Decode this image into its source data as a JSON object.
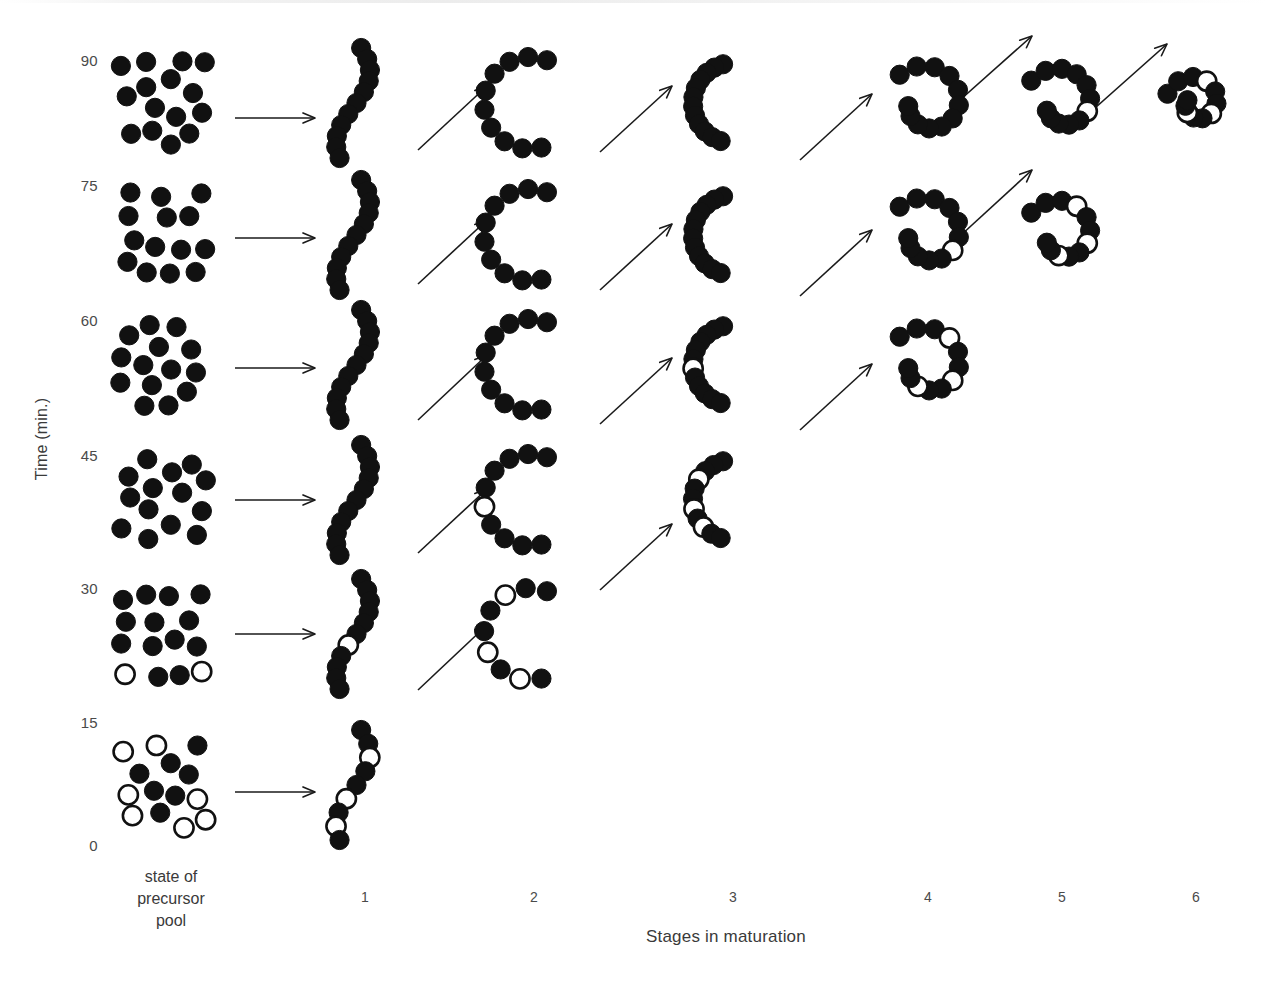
{
  "figure": {
    "kind": "time-course maturation diagram",
    "background_color": "#ffffff",
    "bead_filled_color": "#111111",
    "bead_open_color": "#ffffff",
    "bead_outline_color": "#111111",
    "arrow_color": "#1a1a1a"
  },
  "axes": {
    "y_label": "Time (min.)",
    "y_ticks": [
      "90",
      "75",
      "60",
      "45",
      "30",
      "15",
      "0"
    ],
    "x_label": "Stages in maturation",
    "x_ticks": [
      "1",
      "2",
      "3",
      "4",
      "5",
      "6"
    ],
    "pool_caption_line1": "state of",
    "pool_caption_line2": "precursor",
    "pool_caption_line3": "pool"
  },
  "chart_data": {
    "type": "scatter",
    "title": "",
    "xlabel": "Stages in maturation",
    "ylabel": "Time (min.)",
    "ylim": [
      0,
      90
    ],
    "y_tick_values": [
      0,
      15,
      30,
      45,
      60,
      75,
      90
    ],
    "x_categories": [
      "state of precursor pool",
      "1",
      "2",
      "3",
      "4",
      "5",
      "6"
    ],
    "grid": false,
    "legend": "none",
    "rows": [
      {
        "time": 90,
        "pool": {
          "total": 15,
          "open": 0,
          "filled": 15
        },
        "stages": [
          {
            "stage": 1,
            "beads": 11,
            "open": 0,
            "shape": "extended s-curve chain"
          },
          {
            "stage": 2,
            "beads": 10,
            "open": 0,
            "shape": "open C arc"
          },
          {
            "stage": 3,
            "beads": 12,
            "open": 0,
            "shape": "closed horseshoe"
          },
          {
            "stage": 4,
            "beads": 12,
            "open": 0,
            "shape": "compact spiral"
          },
          {
            "stage": 5,
            "beads": 12,
            "open": 1,
            "shape": "tight spiral"
          },
          {
            "stage": 6,
            "beads": 12,
            "open": 3,
            "shape": "condensed particle"
          }
        ]
      },
      {
        "time": 75,
        "pool": {
          "total": 14,
          "open": 0,
          "filled": 14
        },
        "stages": [
          {
            "stage": 1,
            "beads": 11,
            "open": 0,
            "shape": "extended s-curve chain"
          },
          {
            "stage": 2,
            "beads": 10,
            "open": 0,
            "shape": "open C arc"
          },
          {
            "stage": 3,
            "beads": 12,
            "open": 0,
            "shape": "closed horseshoe"
          },
          {
            "stage": 4,
            "beads": 12,
            "open": 1,
            "shape": "compact spiral"
          },
          {
            "stage": 5,
            "beads": 12,
            "open": 3,
            "shape": "tight spiral"
          }
        ]
      },
      {
        "time": 60,
        "pool": {
          "total": 14,
          "open": 0,
          "filled": 14
        },
        "stages": [
          {
            "stage": 1,
            "beads": 11,
            "open": 0,
            "shape": "extended s-curve chain"
          },
          {
            "stage": 2,
            "beads": 10,
            "open": 0,
            "shape": "open C arc"
          },
          {
            "stage": 3,
            "beads": 12,
            "open": 1,
            "shape": "closed horseshoe"
          },
          {
            "stage": 4,
            "beads": 12,
            "open": 3,
            "shape": "compact spiral"
          }
        ]
      },
      {
        "time": 45,
        "pool": {
          "total": 15,
          "open": 0,
          "filled": 15
        },
        "stages": [
          {
            "stage": 1,
            "beads": 11,
            "open": 0,
            "shape": "extended s-curve chain"
          },
          {
            "stage": 2,
            "beads": 10,
            "open": 1,
            "shape": "open C arc"
          },
          {
            "stage": 3,
            "beads": 11,
            "open": 3,
            "shape": "hook / open spiral"
          }
        ]
      },
      {
        "time": 30,
        "pool": {
          "total": 16,
          "open": 2,
          "filled": 14
        },
        "stages": [
          {
            "stage": 1,
            "beads": 11,
            "open": 1,
            "shape": "hooked chain"
          },
          {
            "stage": 2,
            "beads": 9,
            "open": 3,
            "shape": "open C arc"
          }
        ]
      },
      {
        "time": 15,
        "pool": {
          "total": 18,
          "open": 7,
          "filled": 11
        },
        "stages": [
          {
            "stage": 1,
            "beads": 9,
            "open": 3,
            "shape": "short s-curve chain"
          }
        ]
      }
    ]
  }
}
